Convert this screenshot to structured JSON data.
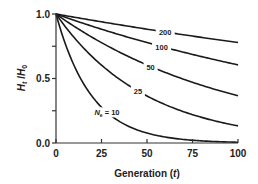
{
  "chart_data": {
    "type": "line",
    "title": "",
    "xlabel": "Generation (t)",
    "xlabel_main": "Generation (",
    "xlabel_var": "t",
    "xlabel_close": ")",
    "ylabel": "Ht/H0",
    "ylabel_H": "H",
    "ylabel_sub_t": "t",
    "ylabel_slash": " /",
    "ylabel_H0": "H",
    "ylabel_sub_0": "0",
    "xlim": [
      0,
      100
    ],
    "ylim": [
      0,
      1
    ],
    "xticks": [
      0,
      25,
      50,
      75,
      100
    ],
    "xtick_labels": [
      "0",
      "25",
      "50",
      "75",
      "100"
    ],
    "yticks": [
      0,
      0.5,
      1.0
    ],
    "ytick_labels": [
      "0.0",
      "0.5",
      "1.0"
    ],
    "grid": false,
    "formula": "Ht/H0 = (1 - 1/(2Ne))^t",
    "series": [
      {
        "name": "200",
        "Ne": 200,
        "label": "200",
        "x": [
          0,
          25,
          50,
          75,
          100
        ],
        "values": [
          1.0,
          0.94,
          0.882,
          0.829,
          0.779
        ]
      },
      {
        "name": "100",
        "Ne": 100,
        "label": "100",
        "x": [
          0,
          25,
          50,
          75,
          100
        ],
        "values": [
          1.0,
          0.882,
          0.778,
          0.687,
          0.606
        ]
      },
      {
        "name": "50",
        "Ne": 50,
        "label": "50",
        "x": [
          0,
          25,
          50,
          75,
          100
        ],
        "values": [
          1.0,
          0.778,
          0.605,
          0.471,
          0.366
        ]
      },
      {
        "name": "25",
        "Ne": 25,
        "label": "25",
        "x": [
          0,
          25,
          50,
          75,
          100
        ],
        "values": [
          1.0,
          0.603,
          0.364,
          0.219,
          0.133
        ]
      },
      {
        "name": "10",
        "Ne": 10,
        "label": "Ne = 10",
        "label_var": "N",
        "label_sub": "e",
        "label_eq": " = 10",
        "x": [
          0,
          25,
          50,
          75,
          100
        ],
        "values": [
          1.0,
          0.277,
          0.077,
          0.021,
          0.006
        ]
      }
    ]
  }
}
